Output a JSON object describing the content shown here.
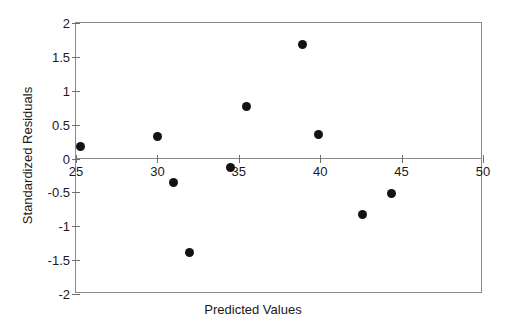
{
  "chart_data": {
    "type": "scatter",
    "title": "",
    "xlabel": "Predicted Values",
    "ylabel": "Standardized Residuals",
    "xlim": [
      25,
      50
    ],
    "ylim": [
      -2,
      2
    ],
    "xticks": [
      25,
      30,
      35,
      40,
      45,
      50
    ],
    "xtick_labels": [
      "25",
      "30",
      "35",
      "40",
      "45",
      "50"
    ],
    "yticks": [
      2,
      1.5,
      1,
      0.5,
      0,
      -0.5,
      -1,
      -1.5,
      -2
    ],
    "ytick_labels": [
      "2",
      "1.5",
      "1",
      "0.5",
      "0",
      "-0.5",
      "-1",
      "-1.5",
      "-2"
    ],
    "grid": false,
    "legend": null,
    "zero_line": true,
    "marker": "filled-circle",
    "marker_color": "#131313",
    "axis_color": "#8a8a8a",
    "background": "#ffffff",
    "points": [
      {
        "x": 25.3,
        "y": 0.18
      },
      {
        "x": 30.0,
        "y": 0.33
      },
      {
        "x": 31.0,
        "y": -0.36
      },
      {
        "x": 32.0,
        "y": -1.39
      },
      {
        "x": 34.5,
        "y": -0.13
      },
      {
        "x": 35.5,
        "y": 0.77
      },
      {
        "x": 38.9,
        "y": 1.69
      },
      {
        "x": 39.9,
        "y": 0.36
      },
      {
        "x": 42.6,
        "y": -0.83
      },
      {
        "x": 44.4,
        "y": -0.51
      }
    ]
  }
}
